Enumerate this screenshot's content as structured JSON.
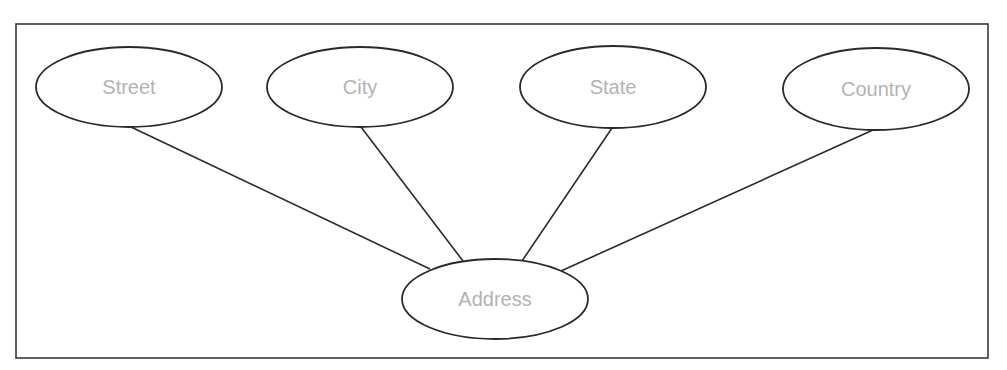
{
  "diagram": {
    "type": "entity-attribute (ER composite attribute)",
    "colors": {
      "frame": "#3a3a3a",
      "stroke": "#2a2a2a",
      "label": "#b3b3b3",
      "background": "#ffffff"
    },
    "frame": {
      "x": 16,
      "y": 24,
      "width": 972,
      "height": 334
    },
    "nodes": [
      {
        "id": "street",
        "label": "Street",
        "shape": "ellipse",
        "cx": 129,
        "cy": 87,
        "rx": 93,
        "ry": 40
      },
      {
        "id": "city",
        "label": "City",
        "shape": "ellipse",
        "cx": 360,
        "cy": 87,
        "rx": 93,
        "ry": 40
      },
      {
        "id": "state",
        "label": "State",
        "shape": "ellipse",
        "cx": 613,
        "cy": 87,
        "rx": 93,
        "ry": 41
      },
      {
        "id": "country",
        "label": "Country",
        "shape": "ellipse",
        "cx": 876,
        "cy": 89,
        "rx": 93,
        "ry": 41
      },
      {
        "id": "address",
        "label": "Address",
        "shape": "ellipse",
        "cx": 495,
        "cy": 299,
        "rx": 93,
        "ry": 40
      }
    ],
    "edges": [
      {
        "from": "street",
        "to": "address",
        "x1": 131,
        "y1": 127,
        "x2": 430,
        "y2": 269
      },
      {
        "from": "city",
        "to": "address",
        "x1": 361,
        "y1": 127,
        "x2": 463,
        "y2": 261
      },
      {
        "from": "state",
        "to": "address",
        "x1": 612,
        "y1": 128,
        "x2": 522,
        "y2": 261
      },
      {
        "from": "country",
        "to": "address",
        "x1": 873,
        "y1": 130,
        "x2": 561,
        "y2": 271
      }
    ]
  }
}
